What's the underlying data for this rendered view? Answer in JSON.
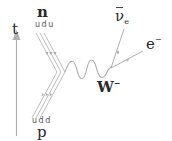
{
  "diagram": {
    "type": "feynman",
    "time_axis": {
      "label": "t"
    },
    "incoming": {
      "particle": "n",
      "quarks": "udu"
    },
    "outgoing_hadron": {
      "particle": "p",
      "quarks": "udd"
    },
    "boson": {
      "symbol": "W",
      "charge": "−"
    },
    "leptons": [
      {
        "symbol": "ν",
        "bar": true,
        "subscript": "e"
      },
      {
        "symbol": "e",
        "charge": "−"
      }
    ]
  },
  "colors": {
    "line": "#b0b0b0",
    "text": "#2a2a2a"
  }
}
